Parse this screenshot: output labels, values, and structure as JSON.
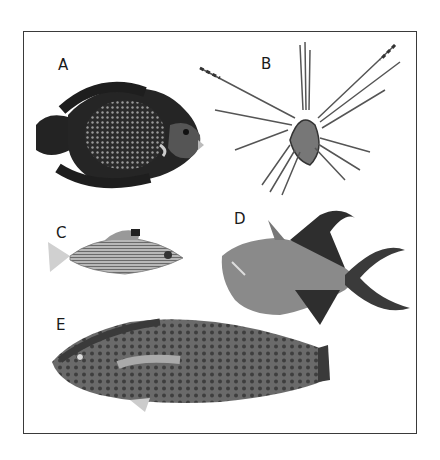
{
  "figure": {
    "panels": [
      {
        "label": "A",
        "subject": "angelfish-illustration"
      },
      {
        "label": "B",
        "subject": "lionfish-illustration"
      },
      {
        "label": "C",
        "subject": "squirrelfish-illustration"
      },
      {
        "label": "D",
        "subject": "triggerfish-illustration"
      },
      {
        "label": "E",
        "subject": "parrotfish-illustration"
      }
    ]
  }
}
